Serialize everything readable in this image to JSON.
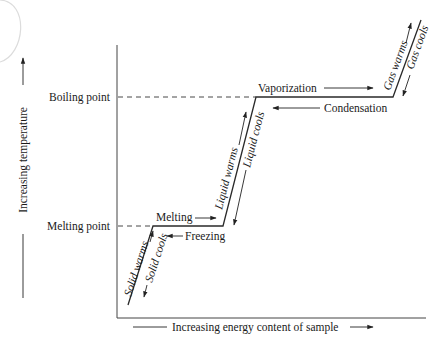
{
  "diagram": {
    "type": "heating-curve",
    "y_axis": {
      "label": "Increasing temperature",
      "ticks": [
        "Boiling point",
        "Melting point"
      ]
    },
    "x_axis": {
      "label": "Increasing energy content of sample"
    },
    "segments": {
      "solid": {
        "up": "Solid warms",
        "down": "Solid cools"
      },
      "melt": {
        "forward": "Melting",
        "reverse": "Freezing"
      },
      "liquid": {
        "up": "Liquid warms",
        "down": "Liquid cools"
      },
      "boil": {
        "forward": "Vaporization",
        "reverse": "Condensation"
      },
      "gas": {
        "up": "Gas warms",
        "down": "Gas cools"
      }
    },
    "colors": {
      "line": "#2a2a2a",
      "text": "#1a1a1a",
      "decor_arc": "#d9d9d9"
    }
  }
}
